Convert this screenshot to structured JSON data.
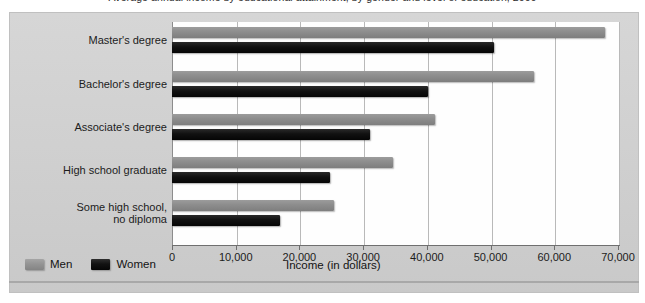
{
  "chart_data": {
    "type": "bar",
    "orientation": "horizontal",
    "title": "Average annual income by educational attainment, by gender and level of education, 2009",
    "xlabel": "Income (in dollars)",
    "ylabel": "",
    "categories": [
      "Master's degree",
      "Bachelor's degree",
      "Associate's degree",
      "High school graduate",
      "Some high school, no diploma"
    ],
    "series": [
      {
        "name": "Men",
        "color": "#8e8e8e",
        "values": [
          68000,
          56800,
          41200,
          34700,
          25400
        ]
      },
      {
        "name": "Women",
        "color": "#111111",
        "values": [
          50500,
          40200,
          31100,
          24800,
          17000
        ]
      }
    ],
    "xlim": [
      0,
      70000
    ],
    "xticks": [
      0,
      10000,
      20000,
      30000,
      40000,
      50000,
      60000,
      70000
    ],
    "xtick_labels": [
      "0",
      "10,000",
      "20,000",
      "30,000",
      "40,000",
      "50,000",
      "60,000",
      "70,000"
    ],
    "grid": true,
    "grid_axis": "x",
    "legend_position": "bottom-left",
    "legend_entries": [
      "Men",
      "Women"
    ],
    "background_color": "#d2d2d2",
    "plot_background_color": "#fefefe"
  },
  "category_lines": [
    [
      "Master's degree"
    ],
    [
      "Bachelor's degree"
    ],
    [
      "Associate's degree"
    ],
    [
      "High school graduate"
    ],
    [
      "Some high school,",
      "no diploma"
    ]
  ],
  "legend": {
    "men_label": "Men",
    "women_label": "Women"
  },
  "axis": {
    "x_title": "Income (in dollars)"
  }
}
